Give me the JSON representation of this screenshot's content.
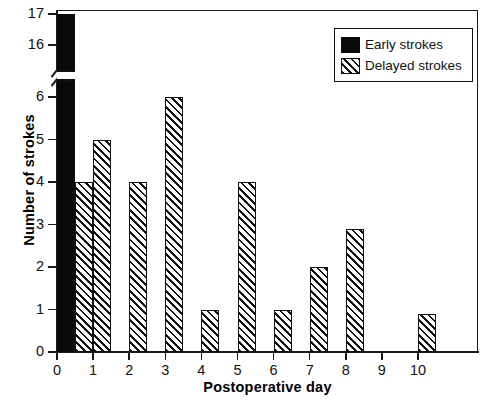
{
  "chart_data": {
    "type": "bar",
    "title": "",
    "xlabel": "Postoperative day",
    "ylabel": "Number of strokes",
    "categories": [
      "0",
      "1",
      "2",
      "3",
      "4",
      "5",
      "6",
      "7",
      "8",
      "9",
      "10"
    ],
    "grid": false,
    "legend_position": "top-right",
    "broken_axis": true,
    "axis_break_between": [
      6,
      16
    ],
    "ylim_lower": [
      0,
      6
    ],
    "ylim_upper": [
      16,
      17
    ],
    "ytick_labels_lower": [
      "0",
      "1",
      "2",
      "3",
      "4",
      "5",
      "6"
    ],
    "ytick_labels_upper": [
      "16",
      "17"
    ],
    "xtick_labels": [
      "0",
      "1",
      "2",
      "3",
      "4",
      "5",
      "6",
      "7",
      "8",
      "9",
      "10"
    ],
    "series": [
      {
        "name": "Early strokes",
        "fill": "solid",
        "color": "#0a0a0a",
        "values": [
          17,
          0,
          0,
          0,
          0,
          0,
          0,
          0,
          0,
          0,
          0
        ]
      },
      {
        "name": "Delayed strokes",
        "fill": "hatch",
        "color": "#111111",
        "values": [
          4,
          5,
          4,
          6,
          1,
          4,
          1,
          2,
          2.9,
          0,
          0.9
        ]
      }
    ]
  },
  "legend": {
    "entries": [
      {
        "label": "Early strokes",
        "swatch": "solid-black-square"
      },
      {
        "label": "Delayed strokes",
        "swatch": "hatched-square"
      }
    ]
  }
}
